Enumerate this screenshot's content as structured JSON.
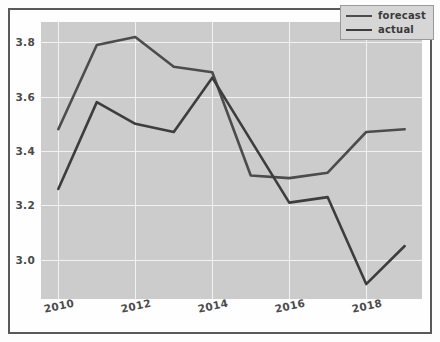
{
  "chart_data": {
    "type": "line",
    "title": "",
    "xlabel": "",
    "ylabel": "",
    "x": [
      2010,
      2011,
      2012,
      2013,
      2014,
      2015,
      2016,
      2017,
      2018,
      2019
    ],
    "xlim": [
      2009.55,
      2019.45
    ],
    "ylim": [
      2.855,
      3.875
    ],
    "xticks": [
      2010,
      2012,
      2014,
      2016,
      2018
    ],
    "xtick_labels": [
      "2010",
      "2012",
      "2014",
      "2016",
      "2018"
    ],
    "yticks": [
      3.0,
      3.2,
      3.4,
      3.6,
      3.8
    ],
    "ytick_labels": [
      "3.0",
      "3.2",
      "3.4",
      "3.6",
      "3.8"
    ],
    "grid": true,
    "legend_position": "upper right",
    "series": [
      {
        "name": "forecast",
        "color": "#4c4c4c",
        "values": [
          3.48,
          3.79,
          3.82,
          3.71,
          3.69,
          3.31,
          3.3,
          3.32,
          3.47,
          3.48
        ]
      },
      {
        "name": "actual",
        "color": "#3d3d3d",
        "values": [
          3.26,
          3.58,
          3.5,
          3.47,
          3.67,
          3.44,
          3.21,
          3.23,
          2.91,
          3.05
        ]
      }
    ]
  },
  "style": {
    "plot_background": "#cccccc",
    "figure_background": "#fefefe",
    "grid_color": "#f2f2f2",
    "frame_border_color": "#595959",
    "tick_label_color": "#4a4a4a",
    "legend_background": "#d6d6d6",
    "legend_border": "#9a9a9a"
  }
}
